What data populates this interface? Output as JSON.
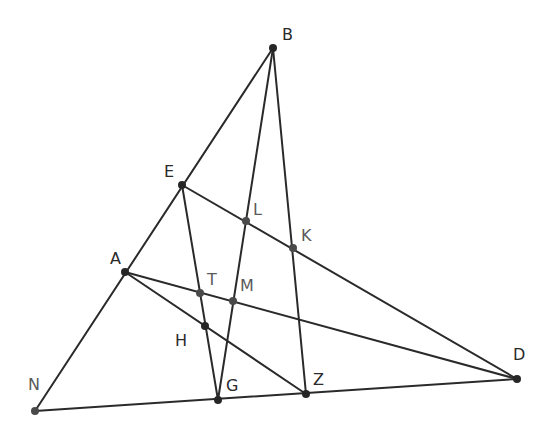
{
  "diagram": {
    "points": {
      "B": {
        "x": 273,
        "y": 48,
        "label": "B",
        "lx": 282,
        "ly": 40
      },
      "E": {
        "x": 182,
        "y": 185,
        "label": "E",
        "lx": 164,
        "ly": 177
      },
      "A": {
        "x": 125,
        "y": 272,
        "label": "A",
        "lx": 110,
        "ly": 264
      },
      "N": {
        "x": 35,
        "y": 411,
        "label": "N",
        "lx": 28,
        "ly": 390
      },
      "L": {
        "x": 246,
        "y": 221,
        "label": "L",
        "lx": 253,
        "ly": 215
      },
      "K": {
        "x": 293,
        "y": 248,
        "label": "K",
        "lx": 301,
        "ly": 241
      },
      "T": {
        "x": 200,
        "y": 293,
        "label": "T",
        "lx": 207,
        "ly": 285
      },
      "M": {
        "x": 233,
        "y": 301,
        "label": "M",
        "lx": 240,
        "ly": 291
      },
      "H": {
        "x": 205,
        "y": 326,
        "label": "H",
        "lx": 175,
        "ly": 346
      },
      "G": {
        "x": 218,
        "y": 400,
        "label": "G",
        "lx": 226,
        "ly": 391
      },
      "Z": {
        "x": 306,
        "y": 394,
        "label": "Z",
        "lx": 313,
        "ly": 385
      },
      "D": {
        "x": 517,
        "y": 379,
        "label": "D",
        "lx": 513,
        "ly": 360
      }
    },
    "segments": [
      [
        "B",
        "N"
      ],
      [
        "N",
        "D"
      ],
      [
        "E",
        "D"
      ],
      [
        "A",
        "D"
      ],
      [
        "A",
        "Z"
      ],
      [
        "B",
        "G"
      ],
      [
        "B",
        "Z"
      ],
      [
        "E",
        "G"
      ]
    ],
    "line_color": "#2a2a2a",
    "point_color": "#262626"
  }
}
